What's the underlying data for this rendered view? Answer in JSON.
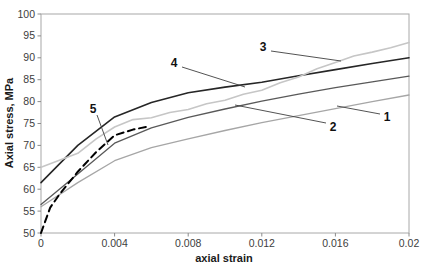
{
  "chart_data": {
    "type": "line",
    "title": "",
    "xlabel": "axial strain",
    "ylabel": "Axial stress, MPa",
    "xlim": [
      0,
      0.02
    ],
    "ylim": [
      50,
      100
    ],
    "grid": false,
    "legend": "none (curves numbered by in-plot callout labels 1-5)",
    "x_ticks": [
      {
        "value": 0,
        "label": "0"
      },
      {
        "value": 0.004,
        "label": "0.004"
      },
      {
        "value": 0.008,
        "label": "0.008"
      },
      {
        "value": 0.012,
        "label": "0.012"
      },
      {
        "value": 0.016,
        "label": "0.016"
      },
      {
        "value": 0.02,
        "label": "0.02"
      }
    ],
    "y_ticks": [
      {
        "value": 50,
        "label": "50"
      },
      {
        "value": 55,
        "label": "55"
      },
      {
        "value": 60,
        "label": "60"
      },
      {
        "value": 65,
        "label": "65"
      },
      {
        "value": 70,
        "label": "70"
      },
      {
        "value": 75,
        "label": "75"
      },
      {
        "value": 80,
        "label": "80"
      },
      {
        "value": 85,
        "label": "85"
      },
      {
        "value": 90,
        "label": "90"
      },
      {
        "value": 95,
        "label": "95"
      },
      {
        "value": 100,
        "label": "100"
      }
    ],
    "series": [
      {
        "name": "1",
        "style": "solid",
        "color": "#a6a6a6",
        "width": 1.3,
        "dash": null,
        "x": [
          0,
          0.002,
          0.004,
          0.006,
          0.008,
          0.01,
          0.012,
          0.014,
          0.016,
          0.018,
          0.02
        ],
        "y": [
          56,
          61.5,
          66.5,
          69.5,
          71.5,
          73.4,
          75.2,
          76.8,
          78.4,
          80,
          81.5
        ]
      },
      {
        "name": "2",
        "style": "solid",
        "color": "#595959",
        "width": 1.3,
        "dash": null,
        "x": [
          0,
          0.002,
          0.004,
          0.006,
          0.008,
          0.01,
          0.012,
          0.014,
          0.016,
          0.018,
          0.02
        ],
        "y": [
          56.5,
          63.5,
          70.5,
          74,
          76.4,
          78.3,
          80.1,
          81.7,
          83.2,
          84.5,
          85.8
        ]
      },
      {
        "name": "4",
        "style": "solid",
        "color": "#262626",
        "width": 1.6,
        "dash": null,
        "x": [
          0,
          0.002,
          0.004,
          0.006,
          0.008,
          0.01,
          0.012,
          0.014,
          0.016,
          0.018,
          0.02
        ],
        "y": [
          61.5,
          70,
          76.5,
          79.8,
          82,
          83.3,
          84.4,
          85.9,
          87.3,
          88.7,
          90
        ]
      },
      {
        "name": "3",
        "style": "solid-jagged",
        "color": "#c6c6c6",
        "width": 1.6,
        "dash": null,
        "x": [
          0,
          0.001,
          0.002,
          0.003,
          0.004,
          0.005,
          0.006,
          0.007,
          0.008,
          0.009,
          0.01,
          0.011,
          0.012,
          0.013,
          0.014,
          0.015,
          0.016,
          0.017,
          0.018,
          0.019,
          0.02
        ],
        "y": [
          65,
          66.6,
          68.2,
          71.5,
          74.2,
          75.9,
          76.3,
          77.5,
          78.2,
          79.5,
          80.3,
          81.7,
          82.6,
          84.3,
          85.6,
          87.5,
          88.9,
          90.4,
          91.3,
          92.3,
          93.5
        ]
      },
      {
        "name": "5",
        "style": "dashed",
        "color": "#000000",
        "width": 2,
        "dash": "7 4.5",
        "x": [
          0,
          0.0005,
          0.001,
          0.002,
          0.003,
          0.004,
          0.005,
          0.0057
        ],
        "y": [
          50,
          55.8,
          58.8,
          64,
          68.5,
          72.3,
          73.6,
          74.2
        ]
      }
    ],
    "annotations": [
      {
        "text": "1",
        "label_pos": [
          387,
          117
        ],
        "leader": [
          [
            380,
            114
          ],
          [
            337,
            106
          ]
        ]
      },
      {
        "text": "2",
        "label_pos": [
          333,
          127
        ],
        "leader": [
          [
            326,
            123
          ],
          [
            235,
            105
          ]
        ]
      },
      {
        "text": "3",
        "label_pos": [
          263,
          47
        ],
        "leader": [
          [
            271,
            51
          ],
          [
            341,
            61
          ]
        ]
      },
      {
        "text": "4",
        "label_pos": [
          174,
          63
        ],
        "leader": [
          [
            182,
            67
          ],
          [
            245,
            87
          ]
        ]
      },
      {
        "text": "5",
        "label_pos": [
          93,
          109
        ],
        "leader": [
          [
            97,
            115
          ],
          [
            108,
            145
          ]
        ]
      }
    ],
    "axis_color": "#a8a8a8",
    "tick_color": "#8c8c8c",
    "leader_color": "#404040"
  }
}
